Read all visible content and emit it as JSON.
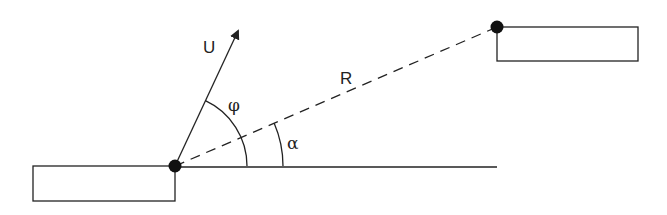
{
  "diagram": {
    "type": "geometry",
    "labels": {
      "velocity": "U",
      "distance": "R",
      "angle_phi": "φ",
      "angle_alpha": "α"
    },
    "colors": {
      "stroke": "#222222",
      "background": "#ffffff"
    },
    "elements": {
      "left_block": {
        "x": 33,
        "y": 166,
        "w": 142,
        "h": 35
      },
      "right_block": {
        "x": 497,
        "y": 27,
        "w": 141,
        "h": 34
      },
      "origin_point": {
        "x": 175,
        "y": 166
      },
      "target_point": {
        "x": 497,
        "y": 27
      },
      "baseline": {
        "x1": 175,
        "y1": 167,
        "x2": 497,
        "y2": 167
      },
      "velocity_arrow": {
        "x1": 175,
        "y1": 166,
        "x2": 238,
        "y2": 31
      },
      "phi_arc_radius": 72,
      "alpha_arc_radius": 108
    }
  }
}
